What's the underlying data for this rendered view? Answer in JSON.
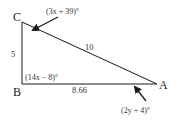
{
  "diagram": {
    "type": "right-triangle",
    "vertices": {
      "A": {
        "label": "A"
      },
      "B": {
        "label": "B"
      },
      "C": {
        "label": "C"
      }
    },
    "sides": {
      "BC": {
        "label": "5"
      },
      "AC": {
        "label": "10"
      },
      "AB": {
        "label": "8.66"
      }
    },
    "angles": {
      "C": {
        "label": "(3x + 39)°"
      },
      "B": {
        "label": "(14x − 8)°"
      },
      "A": {
        "label": "(2y + 4)°"
      }
    },
    "colors": {
      "stroke": "#1a1a1a",
      "text": "#333333",
      "background": "#ffffff"
    }
  }
}
